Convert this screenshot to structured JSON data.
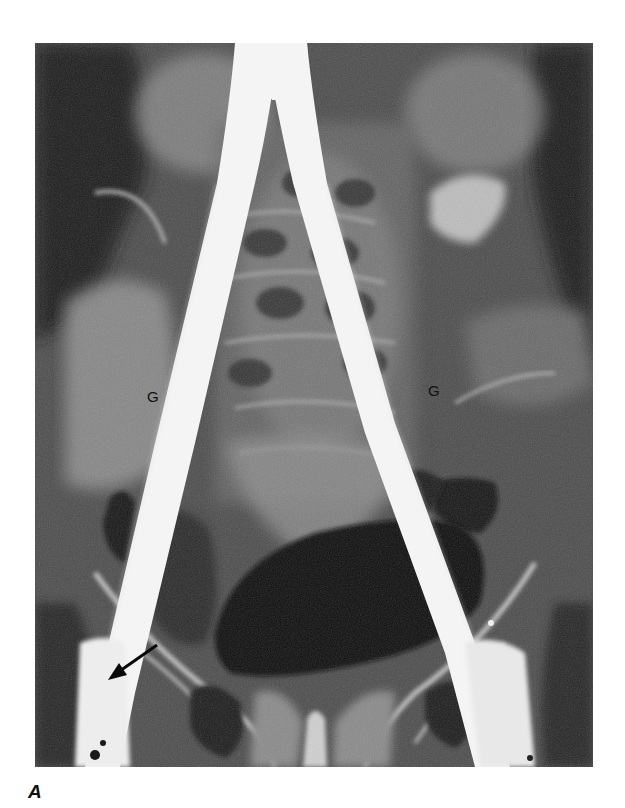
{
  "figure": {
    "panel_label": "A",
    "type": "angiogram-xray",
    "annotations": {
      "graft_left_label": "G",
      "graft_right_label": "G",
      "arrow": "arrow-pointing-lower-left"
    },
    "colors": {
      "background": "#ffffff",
      "graft": "#f4f4f4",
      "dark_gas": "#121212",
      "soft_tissue": "#5a5a5a",
      "bone": "#b8b8b8"
    }
  }
}
